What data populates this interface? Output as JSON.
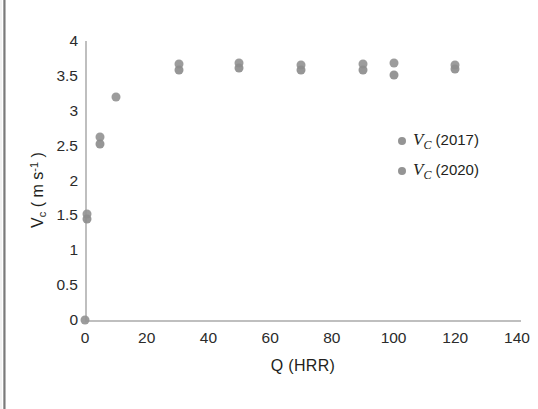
{
  "chart_data": {
    "type": "scatter",
    "title": "",
    "xlabel": "Q (HRR)",
    "ylabel": "V_c ( m s-1 )",
    "ylabel_parts": {
      "symbol": "V",
      "subscript": "c",
      "unit_open": "( m s",
      "superscript": "-1",
      "unit_close": " )"
    },
    "xlim": [
      0,
      140
    ],
    "ylim": [
      0,
      4
    ],
    "xticks": [
      0,
      20,
      40,
      60,
      80,
      100,
      120,
      140
    ],
    "yticks": [
      0,
      0.5,
      1,
      1.5,
      2,
      2.5,
      3,
      3.5,
      4
    ],
    "grid": false,
    "legend_position": "right-inside",
    "marker_color": "#949494",
    "axis_color": "#bfbfbf",
    "series": [
      {
        "name": "Vc (2017)",
        "label_symbol": "V",
        "label_sub": "C",
        "label_year": "(2017)",
        "color": "#949494",
        "points": [
          {
            "x": 0,
            "y": 0
          },
          {
            "x": 0.5,
            "y": 1.52
          },
          {
            "x": 5,
            "y": 2.62
          },
          {
            "x": 10,
            "y": 3.2
          },
          {
            "x": 30.5,
            "y": 3.67
          },
          {
            "x": 50,
            "y": 3.68
          },
          {
            "x": 70,
            "y": 3.66
          },
          {
            "x": 90,
            "y": 3.67
          },
          {
            "x": 100,
            "y": 3.68
          },
          {
            "x": 120,
            "y": 3.66
          }
        ]
      },
      {
        "name": "Vc (2020)",
        "label_symbol": "V",
        "label_sub": "C",
        "label_year": "(2020)",
        "color": "#8d8d8d",
        "points": [
          {
            "x": 0.5,
            "y": 1.45
          },
          {
            "x": 5,
            "y": 2.53
          },
          {
            "x": 30.5,
            "y": 3.59
          },
          {
            "x": 50,
            "y": 3.62
          },
          {
            "x": 70,
            "y": 3.59
          },
          {
            "x": 90,
            "y": 3.58
          },
          {
            "x": 100,
            "y": 3.51
          },
          {
            "x": 120,
            "y": 3.6
          }
        ]
      }
    ]
  },
  "axis": {
    "x_title": "Q (HRR)",
    "x_tick_labels": [
      "0",
      "20",
      "40",
      "60",
      "80",
      "100",
      "120",
      "140"
    ],
    "y_tick_labels": [
      "0",
      "0.5",
      "1",
      "1.5",
      "2",
      "2.5",
      "3",
      "3.5",
      "4"
    ]
  },
  "legend": {
    "items": [
      {
        "symbol": "V",
        "sub": "C",
        "year": "(2017)"
      },
      {
        "symbol": "V",
        "sub": "C",
        "year": "(2020)"
      }
    ]
  }
}
